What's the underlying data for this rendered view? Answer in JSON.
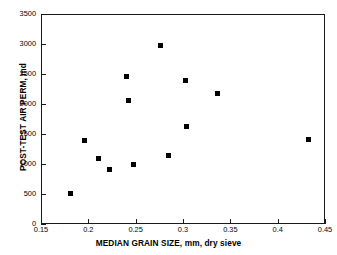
{
  "chart_data": {
    "type": "scatter",
    "title": "",
    "xlabel": "MEDIAN GRAIN SIZE, mm, dry sieve",
    "ylabel": "POST-TEST AIR PERM, md",
    "xlim": [
      0.15,
      0.45
    ],
    "ylim": [
      0,
      3500
    ],
    "grid": false,
    "legend": null,
    "xticks": [
      0.15,
      0.2,
      0.25,
      0.3,
      0.35,
      0.4,
      0.45
    ],
    "xtick_labels": [
      "0.15",
      "0.2",
      "0.25",
      "0.3",
      "0.35",
      "0.4",
      "0.45"
    ],
    "yticks": [
      0,
      500,
      1000,
      1500,
      2000,
      2500,
      3000,
      3500
    ],
    "ytick_labels": [
      "0",
      "500",
      "1000",
      "1500",
      "2000",
      "2500",
      "3000",
      "3500"
    ],
    "marker": "filled-square",
    "marker_color": "#000000",
    "series": [
      {
        "name": "samples",
        "points": [
          {
            "x": 0.181,
            "y": 515
          },
          {
            "x": 0.196,
            "y": 1400
          },
          {
            "x": 0.211,
            "y": 1100
          },
          {
            "x": 0.222,
            "y": 905
          },
          {
            "x": 0.24,
            "y": 2465
          },
          {
            "x": 0.242,
            "y": 2060
          },
          {
            "x": 0.248,
            "y": 985
          },
          {
            "x": 0.276,
            "y": 2980
          },
          {
            "x": 0.285,
            "y": 1150
          },
          {
            "x": 0.303,
            "y": 2400
          },
          {
            "x": 0.304,
            "y": 1630
          },
          {
            "x": 0.336,
            "y": 2180
          },
          {
            "x": 0.433,
            "y": 1415
          }
        ]
      }
    ]
  },
  "colors": {
    "axis": "#1a1a1a",
    "marker": "#000000",
    "background": "#ffffff"
  }
}
